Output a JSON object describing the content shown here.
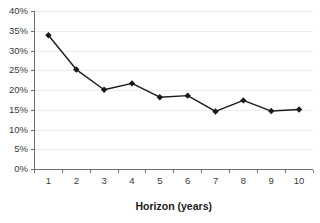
{
  "chart_data": {
    "type": "line",
    "title": "",
    "subtitle": "",
    "xlabel": "Horizon (years)",
    "ylabel": "",
    "categories": [
      1,
      2,
      3,
      4,
      5,
      6,
      7,
      8,
      9,
      10
    ],
    "x_tick_labels": [
      "1",
      "2",
      "3",
      "4",
      "5",
      "6",
      "7",
      "8",
      "9",
      "10"
    ],
    "y_tick_labels": [
      "0%",
      "5%",
      "10%",
      "15%",
      "20%",
      "25%",
      "30%",
      "35%",
      "40%"
    ],
    "y_tick_values": [
      0,
      5,
      10,
      15,
      20,
      25,
      30,
      35,
      40
    ],
    "ylim": [
      0,
      40
    ],
    "xlim": [
      0.5,
      10.5
    ],
    "grid": "horizontal",
    "legend": "none",
    "marker": "diamond",
    "series": [
      {
        "name": "series-1",
        "color": "#1a1a1a",
        "values": [
          34.0,
          25.3,
          20.2,
          21.8,
          18.3,
          18.7,
          14.7,
          17.5,
          14.8,
          15.2
        ]
      }
    ]
  },
  "colors": {
    "line": "#1a1a1a",
    "marker": "#1a1a1a",
    "grid": "#ececec",
    "axis": "#6e6e6e",
    "tick_text": "#3a3a3a",
    "title_text": "#1a1a1a",
    "background": "#ffffff"
  }
}
